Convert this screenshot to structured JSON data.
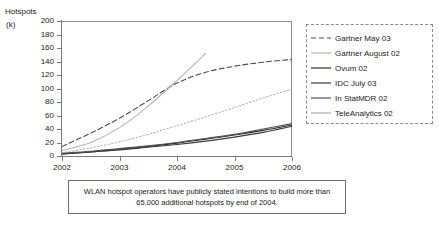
{
  "axis": {
    "y_title_main": "Hotspots",
    "y_title_unit": "(k)"
  },
  "caption": {
    "text": "WLAN hotspot operators have publicly stated intentions to build more than 65,000 additional hotspots by end of 2004."
  },
  "legend": {
    "position": "right",
    "entries": [
      {
        "label": "Gartner May 03",
        "style": "dashed",
        "color": "#4a4a4a"
      },
      {
        "label": "Gartner August 02",
        "style": "solid",
        "color": "#b4b4b4"
      },
      {
        "label": "Ovum 02",
        "style": "solid",
        "color": "#2b2b2b"
      },
      {
        "label": "IDC July 03",
        "style": "solid",
        "color": "#3a3a3a"
      },
      {
        "label": "In StatMDR 02",
        "style": "solid",
        "color": "#4f4f4f"
      },
      {
        "label": "TeleAnalytics 02",
        "style": "solid",
        "color": "#a8a8a8"
      }
    ]
  },
  "chart_data": {
    "type": "line",
    "title": "",
    "xlabel": "",
    "ylabel": "Hotspots (k)",
    "xlim": [
      2002,
      2006
    ],
    "ylim": [
      0,
      200
    ],
    "grid": false,
    "xticks": [
      "2002",
      "2003",
      "2004",
      "2005",
      "2006"
    ],
    "yticks": [
      "0",
      "20",
      "40",
      "60",
      "80",
      "100",
      "120",
      "140",
      "160",
      "180",
      "200"
    ],
    "x": [
      2002,
      2002.5,
      2003,
      2003.5,
      2004,
      2004.5,
      2005,
      2005.5,
      2006
    ],
    "series": [
      {
        "name": "Gartner May 03",
        "style": "dashed",
        "color": "#4a4a4a",
        "values": [
          14,
          34,
          56,
          82,
          108,
          124,
          133,
          139,
          143
        ]
      },
      {
        "name": "Gartner August 02",
        "style": "solid",
        "color": "#b4b4b4",
        "note": "exits top of plot area in mid-2004",
        "values": [
          8,
          20,
          42,
          74,
          112,
          152,
          null,
          null,
          null
        ]
      },
      {
        "name": "Ovum 02",
        "style": "solid",
        "color": "#2b2b2b",
        "values": [
          3,
          6,
          10,
          14,
          19,
          25,
          31,
          38,
          46
        ]
      },
      {
        "name": "IDC July 03",
        "style": "solid",
        "color": "#3a3a3a",
        "values": [
          3,
          6,
          9,
          13,
          17,
          22,
          28,
          35,
          44
        ]
      },
      {
        "name": "In StatMDR 02",
        "style": "solid",
        "color": "#4f4f4f",
        "values": [
          4,
          7,
          11,
          15,
          20,
          26,
          32,
          40,
          48
        ]
      },
      {
        "name": "TeleAnalytics 02",
        "style": "dotted",
        "color": "#a8a8a8",
        "values": [
          5,
          12,
          21,
          32,
          45,
          58,
          72,
          86,
          99
        ]
      }
    ]
  }
}
